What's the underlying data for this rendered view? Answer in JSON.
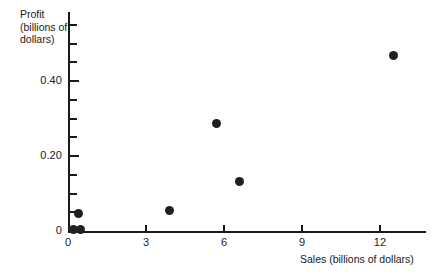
{
  "chart_data": {
    "type": "scatter",
    "title": "",
    "xlabel": "Sales (billions of dollars)",
    "ylabel": "Profit (billions of dollars)",
    "ylabel_lines": [
      "Profit",
      "(billions of",
      "dollars)"
    ],
    "xlim": [
      0,
      13.8
    ],
    "ylim": [
      0,
      0.585
    ],
    "grid": false,
    "legend": null,
    "x_ticks": [
      {
        "value": 0,
        "label": "0",
        "major": true
      },
      {
        "value": 3,
        "label": "3",
        "major": true
      },
      {
        "value": 6,
        "label": "6",
        "major": true
      },
      {
        "value": 9,
        "label": "9",
        "major": true
      },
      {
        "value": 12,
        "label": "12",
        "major": true
      }
    ],
    "y_ticks": [
      {
        "value": 0,
        "label": "0",
        "major": true
      },
      {
        "value": 0.05,
        "label": "",
        "major": false
      },
      {
        "value": 0.1,
        "label": "",
        "major": false
      },
      {
        "value": 0.15,
        "label": "",
        "major": false
      },
      {
        "value": 0.2,
        "label": "0.20",
        "major": true
      },
      {
        "value": 0.25,
        "label": "",
        "major": false
      },
      {
        "value": 0.3,
        "label": "",
        "major": false
      },
      {
        "value": 0.35,
        "label": "",
        "major": false
      },
      {
        "value": 0.4,
        "label": "0.40",
        "major": true
      },
      {
        "value": 0.45,
        "label": "",
        "major": false
      },
      {
        "value": 0.5,
        "label": "",
        "major": false
      },
      {
        "value": 0.55,
        "label": "",
        "major": false
      }
    ],
    "marker": {
      "shape": "circle",
      "color": "#231f20",
      "size_px": 9
    },
    "points": [
      {
        "x": 0.2,
        "y": 0.005
      },
      {
        "x": 0.48,
        "y": 0.005
      },
      {
        "x": 0.42,
        "y": 0.048
      },
      {
        "x": 3.9,
        "y": 0.056
      },
      {
        "x": 5.7,
        "y": 0.288
      },
      {
        "x": 6.6,
        "y": 0.133
      },
      {
        "x": 12.5,
        "y": 0.469
      }
    ]
  }
}
